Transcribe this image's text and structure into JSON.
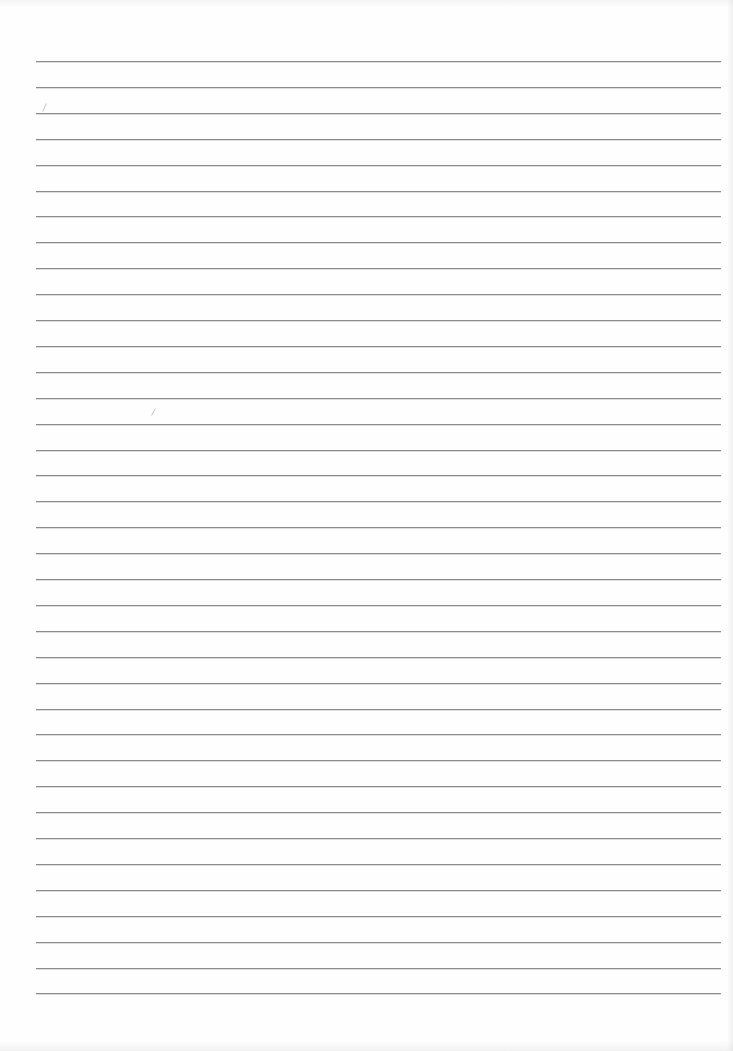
{
  "document": {
    "type": "lined-paper-sheet",
    "text_content": "",
    "rules": {
      "count": 37,
      "first_y": 61,
      "spacing": 25.9,
      "left_x": 36,
      "right_x": 721,
      "color": "#8c8c8c"
    },
    "stray_marks": [
      {
        "x": 44,
        "y": 103,
        "height": 9,
        "angle": 25
      },
      {
        "x": 153,
        "y": 408,
        "height": 8,
        "angle": 30
      }
    ]
  }
}
